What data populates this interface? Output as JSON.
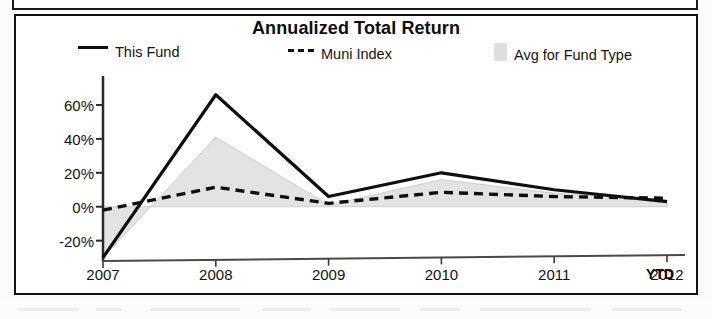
{
  "panel": {
    "title": "Annualized Total Return",
    "ytd_note": "YTD"
  },
  "legend": [
    {
      "label": "This Fund",
      "marker": "solid-line-icon",
      "color": "#0f0f0f"
    },
    {
      "label": "Muni Index",
      "marker": "dashed-line-icon",
      "color": "#0f0f0f"
    },
    {
      "label": "Avg for Fund Type",
      "marker": "gray-swatch-icon",
      "color": "#dedede"
    }
  ],
  "axis": {
    "y_ticks": [
      "60%",
      "40%",
      "20%",
      "0%",
      "-20%"
    ],
    "x_ticks": [
      "2007",
      "2008",
      "2009",
      "2010",
      "2011",
      "2012"
    ]
  },
  "chart_data": {
    "type": "line",
    "title": "Annualized Total Return",
    "xlabel": "",
    "ylabel": "",
    "categories": [
      "2007",
      "2008",
      "2009",
      "2010",
      "2011",
      "2012"
    ],
    "ylim": [
      -32,
      70
    ],
    "yticks": [
      -20,
      0,
      20,
      40,
      60
    ],
    "grid": false,
    "legend_position": "top",
    "series": [
      {
        "name": "This Fund",
        "style": "solid",
        "color": "#0f0f0f",
        "values": [
          -30,
          66,
          6,
          20,
          10,
          3
        ]
      },
      {
        "name": "Muni Index",
        "style": "dashed",
        "color": "#0f0f0f",
        "values": [
          -2,
          11.5,
          2,
          8.5,
          6,
          5
        ]
      },
      {
        "name": "Avg for Fund Type",
        "style": "filled-area",
        "color": "#dedede",
        "values": [
          -30,
          41,
          1,
          16,
          8,
          4
        ]
      }
    ],
    "annotations": [
      "YTD"
    ]
  }
}
